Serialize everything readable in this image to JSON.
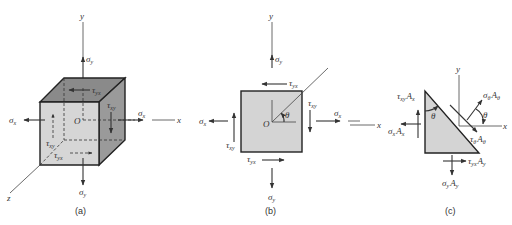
{
  "figure": {
    "panels": [
      {
        "id": "a",
        "caption": "(a)",
        "type": "3D stress element (cube)",
        "axes": {
          "x": "x",
          "y": "y",
          "z": "z",
          "origin": "O"
        },
        "labels": {
          "sigma_y_top": "σ",
          "sigma_y_top_sub": "y",
          "sigma_y_bottom": "σ",
          "sigma_y_bottom_sub": "y",
          "sigma_x_left": "σ",
          "sigma_x_left_sub": "x",
          "sigma_x_right": "σ",
          "sigma_x_right_sub": "x",
          "tau_yx_top": "τ",
          "tau_yx_top_sub": "yx",
          "tau_xy_right": "τ",
          "tau_xy_right_sub": "xy",
          "tau_xy_left": "τ",
          "tau_xy_left_sub": "xy",
          "tau_yx_bottom": "τ",
          "tau_yx_bottom_sub": "yx"
        }
      },
      {
        "id": "b",
        "caption": "(b)",
        "type": "2D plane stress element",
        "axes": {
          "x": "x",
          "y": "y",
          "origin": "O",
          "angle": "θ"
        },
        "labels": {
          "sigma_y_top": "σ",
          "sigma_y_top_sub": "y",
          "sigma_y_bottom": "σ",
          "sigma_y_bottom_sub": "y",
          "sigma_x_left": "σ",
          "sigma_x_left_sub": "x",
          "sigma_x_right": "σ",
          "sigma_x_right_sub": "x",
          "tau_yx_top": "τ",
          "tau_yx_top_sub": "yx",
          "tau_xy_right": "τ",
          "tau_xy_right_sub": "xy",
          "tau_xy_left": "τ",
          "tau_xy_left_sub": "xy",
          "tau_yx_bottom": "τ",
          "tau_yx_bottom_sub": "yx"
        }
      },
      {
        "id": "c",
        "caption": "(c)",
        "type": "Wedge free-body diagram",
        "axes": {
          "x": "x",
          "y": "y",
          "x_left": "x"
        },
        "labels": {
          "tau_xy_Ax": "τ",
          "tau_xy_Ax_sub": "xy",
          "tau_xy_Ax_A": "A",
          "tau_xy_Ax_Asub": "x",
          "sigma_x_Ax": "σ",
          "sigma_x_Ax_sub": "x",
          "sigma_x_Ax_A": "A",
          "sigma_x_Ax_Asub": "x",
          "sigma_theta_A": "σ",
          "sigma_theta_A_sub": "θ",
          "sigma_theta_A_A": "A",
          "sigma_theta_A_Asub": "θ",
          "tau_theta_A": "τ",
          "tau_theta_A_sub": "θ",
          "tau_theta_A_A": "A",
          "tau_theta_A_Asub": "θ",
          "tau_yx_Ay": "τ",
          "tau_yx_Ay_sub": "yx",
          "tau_yx_Ay_A": "A",
          "tau_yx_Ay_Asub": "y",
          "sigma_y_Ay": "σ",
          "sigma_y_Ay_sub": "y",
          "sigma_y_Ay_A": "A",
          "sigma_y_Ay_Asub": "y",
          "theta_wedge": "θ",
          "theta_normal": "θ"
        }
      }
    ],
    "colors": {
      "face_front": "#d6d6d6",
      "face_top": "#8a8a8a",
      "face_right": "#9a9a9a",
      "square_fill": "#d4d4d4",
      "wedge_fill": "#d4d4d4",
      "line": "#333333"
    }
  }
}
